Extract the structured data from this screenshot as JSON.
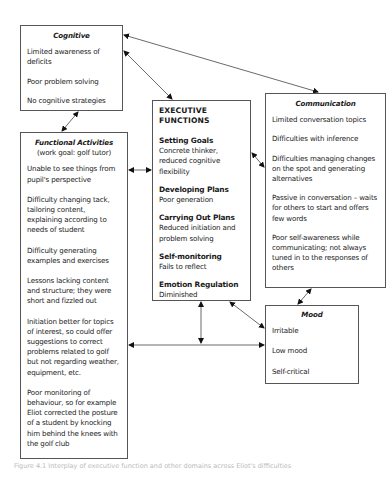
{
  "diagram": {
    "cognitive": {
      "title": "Cognitive",
      "items": [
        "Limited awareness of deficits",
        "Poor problem solving",
        "No cognitive strategies"
      ]
    },
    "functional_activities": {
      "title": "Functional Activities",
      "subtitle": "(work goal: golf tutor)",
      "items": [
        "Unable to see things from pupil's perspective",
        "Difficulty changing tack, tailoring content, explaining according to needs of student",
        "Difficulty generating examples and exercises",
        "Lessons lacking content and structure; they were short and fizzled out",
        "Initiation better for topics of interest, so could offer suggestions to correct problems related to golf but not regarding weather, equipment, etc.",
        "Poor monitoring of behaviour, so for example Eliot corrected the posture of a student by knocking him behind the knees with the golf club"
      ]
    },
    "executive_functions": {
      "title": "EXECUTIVE FUNCTIONS",
      "sections": [
        {
          "heading": "Setting Goals",
          "text": "Concrete thinker, reduced cognitive flexibility"
        },
        {
          "heading": "Developing Plans",
          "text": "Poor generation"
        },
        {
          "heading": "Carrying Out Plans",
          "text": "Reduced initiation and problem solving"
        },
        {
          "heading": "Self-monitoring",
          "text": "Fails to reflect"
        },
        {
          "heading": "Emotion Regulation",
          "text": "Diminished"
        }
      ]
    },
    "communication": {
      "title": "Communication",
      "items": [
        "Limited conversation topics",
        "Difficulties with inference",
        "Difficulties managing changes on the spot and generating alternatives",
        "Passive in conversation – waits for others to start and offers few words",
        "Poor self-awareness while communicating; not always tuned in to the responses of others"
      ]
    },
    "mood": {
      "title": "Mood",
      "items": [
        "Irritable",
        "Low mood",
        "Self-critical"
      ]
    },
    "connections": [
      {
        "from": "communication",
        "to": "cognitive",
        "type": "bidirectional"
      },
      {
        "from": "cognitive",
        "to": "executive_functions",
        "type": "bidirectional"
      },
      {
        "from": "cognitive",
        "to": "functional_activities",
        "type": "bidirectional"
      },
      {
        "from": "functional_activities",
        "to": "executive_functions",
        "type": "bidirectional"
      },
      {
        "from": "executive_functions",
        "to": "communication",
        "type": "bidirectional"
      },
      {
        "from": "communication",
        "to": "mood",
        "type": "bidirectional"
      },
      {
        "from": "executive_functions",
        "to": "mood",
        "type": "bidirectional"
      },
      {
        "from": "executive_functions",
        "to": "functional_mood_link",
        "type": "bidirectional"
      },
      {
        "from": "functional_activities",
        "to": "mood",
        "type": "bidirectional"
      }
    ],
    "caption": "Figure 4.1 Interplay of executive function and other domains across Eliot's difficulties"
  }
}
